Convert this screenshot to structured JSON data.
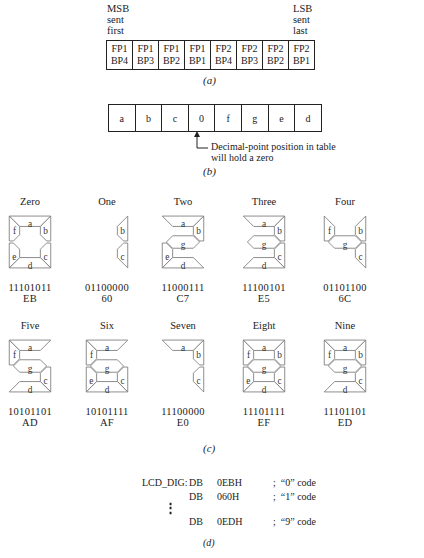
{
  "part_a": {
    "msb_label": [
      "MSB",
      "sent",
      "first"
    ],
    "lsb_label": [
      "LSB",
      "sent",
      "last"
    ],
    "cells": [
      {
        "top": "FP1",
        "bottom": "BP4"
      },
      {
        "top": "FP1",
        "bottom": "BP3"
      },
      {
        "top": "FP1",
        "bottom": "BP2"
      },
      {
        "top": "FP1",
        "bottom": "BP1"
      },
      {
        "top": "FP2",
        "bottom": "BP4"
      },
      {
        "top": "FP2",
        "bottom": "BP3"
      },
      {
        "top": "FP2",
        "bottom": "BP2"
      },
      {
        "top": "FP2",
        "bottom": "BP1"
      }
    ],
    "caption": "(a)"
  },
  "part_b": {
    "cells": [
      "a",
      "b",
      "c",
      "0",
      "f",
      "g",
      "e",
      "d"
    ],
    "note_line1": "Decimal-point position in table",
    "note_line2": "will hold a zero",
    "caption": "(b)"
  },
  "part_c": {
    "digits": [
      {
        "name": "Zero",
        "binary": "11101011",
        "hex": "EB",
        "segments": [
          "a",
          "b",
          "c",
          "d",
          "e",
          "f"
        ]
      },
      {
        "name": "One",
        "binary": "01100000",
        "hex": "60",
        "segments": [
          "b",
          "c"
        ]
      },
      {
        "name": "Two",
        "binary": "11000111",
        "hex": "C7",
        "segments": [
          "a",
          "b",
          "g",
          "e",
          "d"
        ]
      },
      {
        "name": "Three",
        "binary": "11100101",
        "hex": "E5",
        "segments": [
          "a",
          "b",
          "g",
          "c",
          "d"
        ]
      },
      {
        "name": "Four",
        "binary": "01101100",
        "hex": "6C",
        "segments": [
          "f",
          "g",
          "b",
          "c"
        ]
      },
      {
        "name": "Five",
        "binary": "10101101",
        "hex": "AD",
        "segments": [
          "a",
          "f",
          "g",
          "c",
          "d"
        ]
      },
      {
        "name": "Six",
        "binary": "10101111",
        "hex": "AF",
        "segments": [
          "a",
          "f",
          "g",
          "e",
          "c",
          "d"
        ]
      },
      {
        "name": "Seven",
        "binary": "11100000",
        "hex": "E0",
        "segments": [
          "a",
          "b",
          "c"
        ]
      },
      {
        "name": "Eight",
        "binary": "11101111",
        "hex": "EF",
        "segments": [
          "a",
          "b",
          "c",
          "d",
          "e",
          "f",
          "g"
        ]
      },
      {
        "name": "Nine",
        "binary": "11101101",
        "hex": "ED",
        "segments": [
          "a",
          "b",
          "c",
          "d",
          "f",
          "g"
        ]
      }
    ],
    "caption": "(c)"
  },
  "part_d": {
    "label": "LCD_DIG:",
    "lines": [
      {
        "op": "DB",
        "value": "0EBH",
        "comment": ";  “0” code"
      },
      {
        "op": "DB",
        "value": "060H",
        "comment": ";  “1” code"
      },
      {
        "op": "DB",
        "value": "0EDH",
        "comment": ";  “9” code"
      }
    ],
    "ellipsis": "⋮",
    "caption": "(d)"
  }
}
